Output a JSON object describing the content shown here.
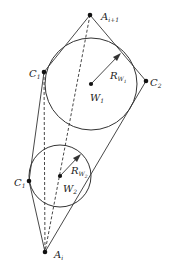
{
  "diagram": {
    "stroke_color": "#333333",
    "points": {
      "A_next": {
        "label": "A",
        "sub": "i+1",
        "x": 90,
        "y": 15
      },
      "C1_upper": {
        "label": "C",
        "sub": "1",
        "x": 44,
        "y": 72
      },
      "C2": {
        "label": "C",
        "sub": "2",
        "x": 146,
        "y": 81
      },
      "W1": {
        "label": "W",
        "sub": "1",
        "x": 91,
        "y": 84
      },
      "C1_lower": {
        "label": "C",
        "sub": "1",
        "x": 29,
        "y": 181
      },
      "W2": {
        "label": "W",
        "sub": "2",
        "x": 60,
        "y": 176
      },
      "A_i": {
        "label": "A",
        "sub": "i",
        "x": 45,
        "y": 252
      }
    },
    "circles": [
      {
        "name": "W1",
        "cx": 91,
        "cy": 84,
        "r": 46
      },
      {
        "name": "W2",
        "cx": 60,
        "cy": 176,
        "r": 31
      }
    ],
    "radius_labels": {
      "R1": {
        "label": "R",
        "sub": "W",
        "subsub": "1"
      },
      "R2": {
        "label": "R",
        "sub": "W",
        "subsub": "2"
      }
    }
  }
}
